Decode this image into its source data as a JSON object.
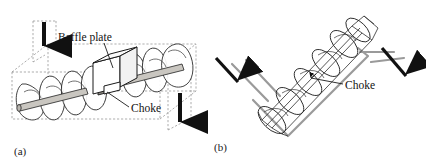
{
  "figure": {
    "width": 426,
    "height": 167,
    "background": "#ffffff",
    "ink_color": "#1a1a1a",
    "casing_color": "#9a9a9a",
    "arrow_color": "#111111"
  },
  "panels": [
    {
      "id": "a",
      "label": "(a)",
      "description": "Horizontal screw conveyor with baffle plate and choke inside a dashed rectangular casing, vertical inlet and outlet arrows",
      "callouts": [
        {
          "name": "baffle-plate",
          "text": "Baffle plate"
        },
        {
          "name": "choke",
          "text": "Choke"
        }
      ],
      "arrows": [
        {
          "name": "inlet-arrow",
          "direction": "down",
          "label": ""
        },
        {
          "name": "outlet-arrow",
          "direction": "down",
          "label": ""
        }
      ]
    },
    {
      "id": "b",
      "label": "(b)",
      "description": "V-shaped inclined trough screw conveyor with choke, diagonal inlet and outlet flow arrows",
      "callouts": [
        {
          "name": "choke",
          "text": "Choke"
        }
      ],
      "arrows": [
        {
          "name": "inlet-arrow",
          "direction": "down-right",
          "label": ""
        },
        {
          "name": "outlet-arrow",
          "direction": "down-right",
          "label": ""
        }
      ]
    }
  ],
  "labels": {
    "baffle_plate": "Baffle plate",
    "choke_a": "Choke",
    "choke_b": "Choke",
    "panel_a": "(a)",
    "panel_b": "(b)"
  }
}
